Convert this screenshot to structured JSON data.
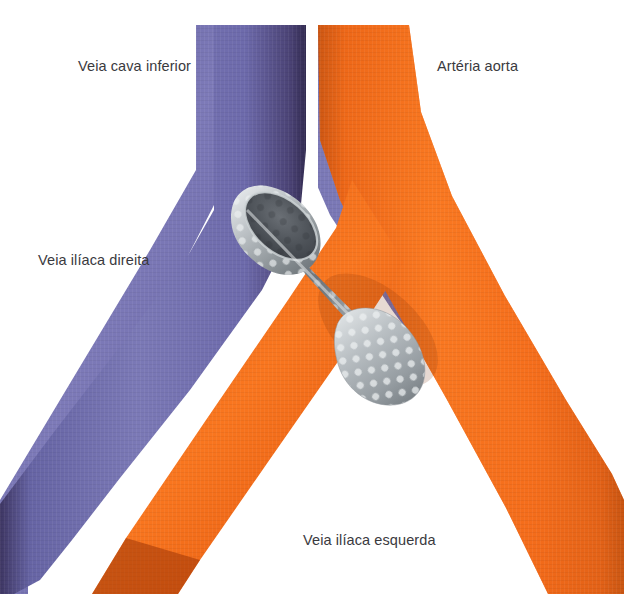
{
  "figure": {
    "kind": "anatomical-illustration",
    "background_color": "#ffffff"
  },
  "labels": [
    {
      "id": "ivc",
      "text": "Veia cava inferior",
      "color": "#3a3a3e",
      "x": 78,
      "y": 59
    },
    {
      "id": "aorta",
      "text": "Artéria aorta",
      "color": "#3a3a3e",
      "x": 437,
      "y": 59
    },
    {
      "id": "rci",
      "text": "Veia ilíaca direita",
      "color": "#3a3a3e",
      "x": 38,
      "y": 253
    },
    {
      "id": "lci",
      "text": "Veia ilíaca esquerda",
      "color": "#3a3a3e",
      "x": 303,
      "y": 533
    }
  ],
  "vessels": [
    {
      "id": "inferior-vena-cava",
      "label": "Veia cava inferior",
      "color": "#6b68a8",
      "shade_dark": "#3b3360",
      "shade_light": "#8d8bc2",
      "position": "upper-left trunk"
    },
    {
      "id": "aorta",
      "label": "Artéria aorta",
      "color": "#f26518",
      "shade_dark": "#b8430c",
      "shade_light": "#ff8a3d",
      "position": "upper-right trunk"
    },
    {
      "id": "right-common-iliac-vein",
      "label": "Veia ilíaca direita",
      "color": "#6b68a8",
      "position": "lower-left branch"
    },
    {
      "id": "left-common-iliac-vein",
      "label": "Veia ilíaca esquerda",
      "color": "#6b68a8",
      "position": "lower-right branch"
    },
    {
      "id": "right-common-iliac-artery",
      "label": "",
      "color": "#f26518",
      "position": "lower-left branch inner"
    },
    {
      "id": "left-common-iliac-artery",
      "label": "",
      "color": "#f26518",
      "position": "lower-right branch outer"
    }
  ],
  "device": {
    "id": "fenestrated-stent",
    "name": "Stent / filtro metálico fenestrado",
    "color_metal_light": "#cfd3d6",
    "color_metal_mid": "#9aa0a4",
    "color_metal_dark": "#6d7378",
    "color_lumen": "#4c4f55",
    "hole_color": "#e4e7e9",
    "orientation": "diagonal, superior-esquerda para inferior-direita",
    "translucent_over_artery": true
  },
  "colors": {
    "vein": "#6b68a8",
    "artery": "#f26518",
    "metal": "#b6bbbf",
    "text": "#3a3a3e",
    "background": "#ffffff"
  }
}
